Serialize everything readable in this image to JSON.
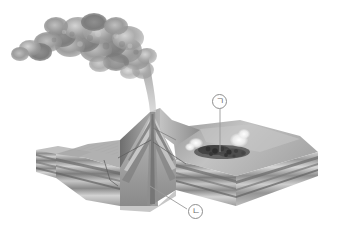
{
  "figure": {
    "background_color": "#ffffff",
    "width": 338,
    "height": 236,
    "style": "grayscale scientific illustration",
    "palette": {
      "background": "#ffffff",
      "plume_dark": "#7a7a7a",
      "plume_mid": "#9e9e9e",
      "plume_light": "#c9c9c9",
      "strata_dark": "#6f6f6f",
      "strata_mid": "#a5a5a5",
      "strata_light": "#dcdcdc",
      "terrain_top": "#b4b4b4",
      "cone_shadow": "#767676",
      "cinder_field": "#4a4a4a",
      "steam_white": "#f2f2f2",
      "leader_line": "#9a9a9a",
      "label_border": "#8e8e8e",
      "label_text": "#6b6b6b"
    }
  },
  "labels": [
    {
      "id": "callout-a",
      "glyph": "ㄱ",
      "name": "callout-label-giyeok",
      "description": "circled Korean letter giyeok pointing to dark cinder/lava field on right flank",
      "x": 212,
      "y": 94,
      "leader": {
        "from_x": 220,
        "from_y": 109,
        "to_x": 220,
        "to_y": 152
      }
    },
    {
      "id": "callout-b",
      "glyph": "ㄴ",
      "name": "callout-label-nieun",
      "description": "circled Korean letter nieun pointing to volcano core conduit at base",
      "x": 188,
      "y": 204,
      "leader": {
        "from_x": 187,
        "from_y": 210,
        "to_x": 150,
        "to_y": 186
      }
    }
  ],
  "features": [
    {
      "name": "ash-plume",
      "description": "billowing grey eruption column drifting to upper left"
    },
    {
      "name": "eruption-jet",
      "description": "narrow vertical gas and ash jet rising from summit crater"
    },
    {
      "name": "summit-crater",
      "description": "central vent at top of cone"
    },
    {
      "name": "central-conduit",
      "description": "vertical magma pipe through the cone interior"
    },
    {
      "name": "layered-cone",
      "description": "alternating lava and tephra layers of the stratovolcano"
    },
    {
      "name": "parasitic-cone",
      "description": "dark cinder and lava field on the right flank"
    },
    {
      "name": "flank-steam",
      "description": "white steam wisps rising from flank vents"
    },
    {
      "name": "sedimentary-strata",
      "description": "horizontal banded bedrock layers exposed in block walls"
    },
    {
      "name": "block-cutaway",
      "description": "three dimensional block diagram with cut faces"
    }
  ]
}
